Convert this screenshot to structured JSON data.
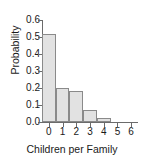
{
  "chart_data": {
    "type": "bar",
    "title": "",
    "subtitle": "",
    "xlabel": "Children per Family",
    "ylabel": "Probability",
    "categories": [
      "0",
      "1",
      "2",
      "3",
      "4",
      "5",
      "6"
    ],
    "values": [
      0.52,
      0.2,
      0.18,
      0.07,
      0.025,
      0.0,
      0.0
    ],
    "series": [
      {
        "name": "Probability",
        "values": [
          0.52,
          0.2,
          0.18,
          0.07,
          0.025,
          0.0,
          0.0
        ]
      }
    ],
    "xlim": [
      -0.5,
      6.5
    ],
    "ylim": [
      0.0,
      0.6
    ],
    "ytick_labels": [
      "0.0",
      "0.1",
      "0.2",
      "0.3",
      "0.4",
      "0.5",
      "0.6"
    ],
    "ytick_values": [
      0.0,
      0.1,
      0.2,
      0.3,
      0.4,
      0.5,
      0.6
    ],
    "xtick_labels": [
      "0",
      "1",
      "2",
      "3",
      "4",
      "5",
      "6"
    ],
    "xtick_values": [
      0,
      1,
      2,
      3,
      4,
      5,
      6
    ],
    "grid": false,
    "legend": false,
    "legend_position": "none",
    "bar_fill_color": "#e2e2e2",
    "bar_edge_color": "#8a8a8a",
    "axis_color": "#6b6b6b",
    "text_color": "#1a1a1a",
    "background_color": "#ffffff"
  }
}
